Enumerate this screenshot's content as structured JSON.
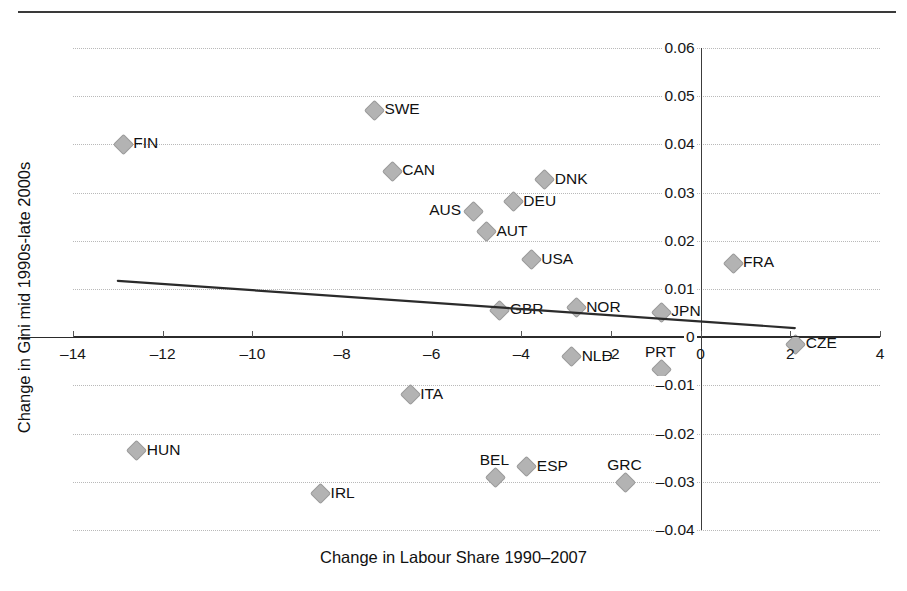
{
  "chart_data": {
    "type": "scatter",
    "title": "",
    "xlabel": "Change in Labour Share 1990–2007",
    "ylabel": "Change in Gini mid 1990s-late 2000s",
    "xlim": [
      -14,
      4
    ],
    "ylim": [
      -0.04,
      0.06
    ],
    "grid": true,
    "legend": "none",
    "xticks": [
      "-14",
      "-12",
      "-10",
      "-8",
      "-6",
      "-4",
      "-2",
      "0",
      "2",
      "4"
    ],
    "xtick_values": [
      -14,
      -12,
      -10,
      -8,
      -6,
      -4,
      -2,
      0,
      2,
      4
    ],
    "yticks": [
      "0.06",
      "0.05",
      "0.04",
      "0.03",
      "0.02",
      "0.01",
      "0",
      "-0.01",
      "-0.02",
      "-0.03",
      "-0.04"
    ],
    "ytick_values": [
      0.06,
      0.05,
      0.04,
      0.03,
      0.02,
      0.01,
      0,
      -0.01,
      -0.02,
      -0.03,
      -0.04
    ],
    "points": [
      {
        "label": "SWE",
        "x": -7.3,
        "y": 0.0473,
        "label_pos": "right"
      },
      {
        "label": "FIN",
        "x": -12.9,
        "y": 0.0402,
        "label_pos": "right"
      },
      {
        "label": "CAN",
        "x": -6.9,
        "y": 0.0346,
        "label_pos": "right"
      },
      {
        "label": "DNK",
        "x": -3.5,
        "y": 0.0329,
        "label_pos": "right"
      },
      {
        "label": "DEU",
        "x": -4.2,
        "y": 0.0283,
        "label_pos": "right"
      },
      {
        "label": "AUS",
        "x": -5.1,
        "y": 0.0263,
        "label_pos": "left"
      },
      {
        "label": "AUT",
        "x": -4.8,
        "y": 0.0221,
        "label_pos": "right"
      },
      {
        "label": "USA",
        "x": -3.8,
        "y": 0.0163,
        "label_pos": "right"
      },
      {
        "label": "FRA",
        "x": 0.7,
        "y": 0.0156,
        "label_pos": "right"
      },
      {
        "label": "GBR",
        "x": -4.5,
        "y": 0.0058,
        "label_pos": "right"
      },
      {
        "label": "NOR",
        "x": -2.8,
        "y": 0.0063,
        "label_pos": "right"
      },
      {
        "label": "JPN",
        "x": -0.9,
        "y": 0.0054,
        "label_pos": "right"
      },
      {
        "label": "CZE",
        "x": 2.1,
        "y": -0.0013,
        "label_pos": "right"
      },
      {
        "label": "NLD",
        "x": -2.9,
        "y": -0.0038,
        "label_pos": "right"
      },
      {
        "label": "PRT",
        "x": -0.9,
        "y": -0.0065,
        "label_pos": "above"
      },
      {
        "label": "ITA",
        "x": -6.5,
        "y": -0.0117,
        "label_pos": "right"
      },
      {
        "label": "HUN",
        "x": -12.6,
        "y": -0.0233,
        "label_pos": "right"
      },
      {
        "label": "ESP",
        "x": -3.9,
        "y": -0.0267,
        "label_pos": "right"
      },
      {
        "label": "BEL",
        "x": -4.6,
        "y": -0.029,
        "label_pos": "above"
      },
      {
        "label": "GRC",
        "x": -1.7,
        "y": -0.03,
        "label_pos": "above"
      },
      {
        "label": "IRL",
        "x": -8.5,
        "y": -0.0323,
        "label_pos": "right"
      }
    ],
    "trendline": {
      "x_start": -13.0,
      "y_start": 0.0117,
      "x_end": 2.1,
      "y_end": 0.0019
    }
  }
}
